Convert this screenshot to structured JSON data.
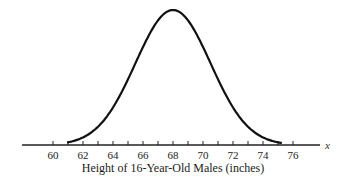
{
  "chart_data": {
    "type": "line",
    "title": "",
    "xlabel": "Height of 16-Year-Old Males (inches)",
    "ylabel": "",
    "axis_variable": "x",
    "x_ticks": [
      60,
      62,
      64,
      66,
      68,
      70,
      72,
      74,
      76
    ],
    "minor_tick_step": 1,
    "xlim": [
      60,
      76
    ],
    "grid": false,
    "legend": null,
    "series": [
      {
        "name": "normal distribution",
        "mean": 68,
        "std_dev": 2.5,
        "x": [
          60,
          61,
          62,
          63,
          64,
          65,
          66,
          67,
          68,
          69,
          70,
          71,
          72,
          73,
          74,
          75,
          76
        ],
        "relative_density": [
          0.006,
          0.02,
          0.056,
          0.135,
          0.278,
          0.487,
          0.726,
          0.923,
          1.0,
          0.923,
          0.726,
          0.487,
          0.278,
          0.135,
          0.056,
          0.02,
          0.006
        ]
      }
    ]
  },
  "labels": {
    "xlabel": "Height of 16-Year-Old Males (inches)",
    "axis_variable": "x",
    "ticks": [
      "60",
      "62",
      "64",
      "66",
      "68",
      "70",
      "72",
      "74",
      "76"
    ]
  }
}
